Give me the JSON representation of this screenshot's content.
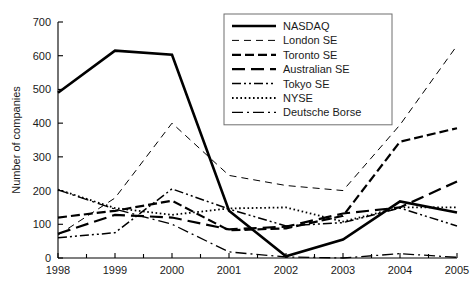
{
  "chart_data": {
    "type": "line",
    "title": "",
    "xlabel": "",
    "ylabel": "Number of companies",
    "categories": [
      "1998",
      "1999",
      "2000",
      "2001",
      "2002",
      "2003",
      "2004",
      "2005"
    ],
    "x": [
      1998,
      1999,
      2000,
      2001,
      2002,
      2003,
      2004,
      2005
    ],
    "ylim": [
      0,
      700
    ],
    "yticks": [
      0,
      100,
      200,
      300,
      400,
      500,
      600,
      700
    ],
    "ytick_labels": [
      "0",
      "100",
      "200",
      "300",
      "400",
      "500",
      "600",
      "700"
    ],
    "grid": false,
    "legend_position": "top-right",
    "series": [
      {
        "name": "NASDAQ",
        "values": [
          490,
          615,
          603,
          140,
          5,
          55,
          168,
          135
        ],
        "style": "solid",
        "width": 2.6,
        "dash": "none"
      },
      {
        "name": "London SE",
        "values": [
          68,
          178,
          400,
          245,
          215,
          200,
          395,
          630
        ],
        "style": "dashed",
        "width": 1.0,
        "dash": "7,5"
      },
      {
        "name": "Toronto SE",
        "values": [
          120,
          140,
          170,
          82,
          88,
          125,
          345,
          385
        ],
        "style": "dash-dot",
        "width": 2.2,
        "dash": "9,4"
      },
      {
        "name": "Australian SE",
        "values": [
          72,
          128,
          120,
          85,
          93,
          132,
          150,
          227
        ],
        "style": "long-dash",
        "width": 2.2,
        "dash": "13,6"
      },
      {
        "name": "Tokyo SE",
        "values": [
          60,
          75,
          205,
          145,
          95,
          105,
          148,
          95
        ],
        "style": "dash-dot-dot",
        "width": 1.5,
        "dash": "9,3,2,3,2,3"
      },
      {
        "name": "NYSE",
        "values": [
          203,
          148,
          128,
          147,
          150,
          108,
          150,
          150
        ],
        "style": "dotted",
        "width": 1.8,
        "dash": "1.6,2.6"
      },
      {
        "name": "Deutsche Borse",
        "values": [
          202,
          145,
          100,
          18,
          3,
          0,
          13,
          2
        ],
        "style": "dash-dot-alt",
        "width": 1.3,
        "dash": "11,4,2,4"
      }
    ]
  }
}
